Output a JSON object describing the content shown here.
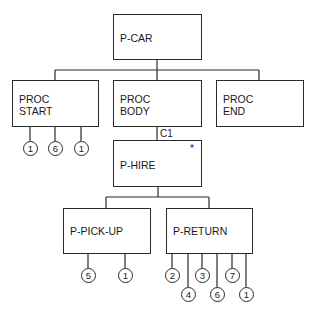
{
  "diagram": {
    "type": "jackson-structure-chart",
    "root": {
      "id": "p_car",
      "label": "P-CAR"
    },
    "level1": [
      {
        "id": "proc_start",
        "label": "PROC\nSTART",
        "operations": [
          "1",
          "6",
          "1"
        ]
      },
      {
        "id": "proc_body",
        "label": "PROC\nBODY",
        "condition": "C1"
      },
      {
        "id": "proc_end",
        "label": "PROC\nEND"
      }
    ],
    "level2": {
      "id": "p_hire",
      "label": "P-HIRE",
      "iteration_marker": "*"
    },
    "level3": [
      {
        "id": "p_pick_up",
        "label": "P-PICK-UP",
        "operations": [
          "5",
          "1"
        ]
      },
      {
        "id": "p_return",
        "label": "P-RETURN",
        "operations": [
          "2",
          "4",
          "3",
          "6",
          "7",
          "1"
        ]
      }
    ]
  }
}
